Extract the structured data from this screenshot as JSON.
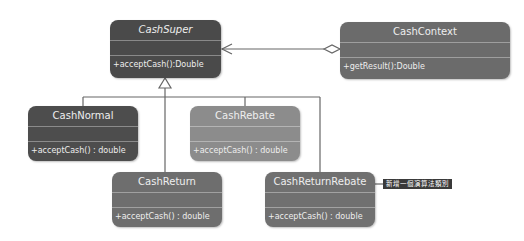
{
  "diagram": {
    "type": "uml-class-diagram",
    "classes": [
      {
        "id": "cashsuper",
        "name": "CashSuper",
        "abstract": true,
        "attributes": [],
        "operations": [
          "+acceptCash():Double"
        ],
        "color": "#4a4a4a"
      },
      {
        "id": "cashcontext",
        "name": "CashContext",
        "abstract": false,
        "attributes": [],
        "operations": [
          "+getResult():Double"
        ],
        "color": "#6b6b6b"
      },
      {
        "id": "cashnormal",
        "name": "CashNormal",
        "abstract": false,
        "attributes": [],
        "operations": [
          "+acceptCash() : double"
        ],
        "color": "#4d4d4d"
      },
      {
        "id": "cashrebate",
        "name": "CashRebate",
        "abstract": false,
        "attributes": [],
        "operations": [
          "+acceptCash() : double"
        ],
        "color": "#8c8c8c"
      },
      {
        "id": "cashreturn",
        "name": "CashReturn",
        "abstract": false,
        "attributes": [],
        "operations": [
          "+acceptCash() : double"
        ],
        "color": "#6e6e6e"
      },
      {
        "id": "cashreturnrebate",
        "name": "CashReturnRebate",
        "abstract": false,
        "attributes": [],
        "operations": [
          "+acceptCash() : double"
        ],
        "color": "#707070"
      }
    ],
    "relationships": [
      {
        "type": "aggregation",
        "from": "cashcontext",
        "to": "cashsuper"
      },
      {
        "type": "generalization",
        "from": "cashnormal",
        "to": "cashsuper"
      },
      {
        "type": "generalization",
        "from": "cashrebate",
        "to": "cashsuper"
      },
      {
        "type": "generalization",
        "from": "cashreturn",
        "to": "cashsuper"
      },
      {
        "type": "generalization",
        "from": "cashreturnrebate",
        "to": "cashsuper"
      }
    ],
    "note": {
      "text": "新增一個演算法類別",
      "attached_to": "cashreturnrebate"
    }
  }
}
